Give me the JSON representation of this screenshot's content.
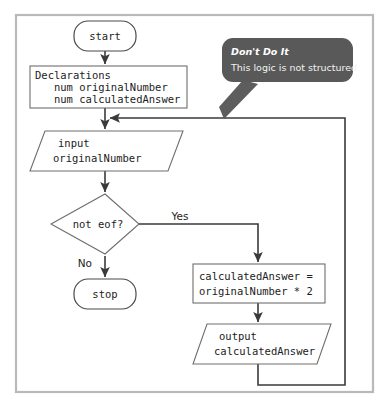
{
  "diagram": {
    "type": "flowchart",
    "nodes": {
      "start": {
        "label": "start",
        "shape": "terminal"
      },
      "declarations": {
        "shape": "process",
        "lines": [
          "Declarations",
          "   num originalNumber",
          "   num calculatedAnswer"
        ]
      },
      "input": {
        "shape": "parallelogram",
        "lines": [
          "input",
          "originalNumber"
        ]
      },
      "decision": {
        "label": "not eof?",
        "shape": "diamond"
      },
      "stop": {
        "label": "stop",
        "shape": "terminal"
      },
      "calculate": {
        "shape": "process",
        "lines": [
          "calculatedAnswer =",
          "originalNumber * 2"
        ]
      },
      "output": {
        "shape": "parallelogram",
        "lines": [
          "output",
          "calculatedAnswer"
        ]
      }
    },
    "edge_labels": {
      "yes": "Yes",
      "no": "No"
    },
    "callout": {
      "title": "Don't Do It",
      "body": "This logic is not structured."
    },
    "colors": {
      "callout_bg": "#595959",
      "shape_stroke": "#6e6e6e",
      "line": "#3a3a3a",
      "frame": "#b9b9b9",
      "background": "#ffffff"
    }
  }
}
